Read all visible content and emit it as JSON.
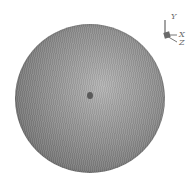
{
  "viewport": {
    "background": "#ffffff",
    "object": {
      "type": "sphere",
      "shading": "gray mesh, lighter center, darker rim",
      "colors": {
        "rim": "#5e5e5e",
        "center": "#b4b4b4",
        "dot": "#5a5a5a"
      }
    }
  },
  "axis_triad": {
    "labels": {
      "y": "Y",
      "x": "X",
      "z": "Z"
    }
  }
}
